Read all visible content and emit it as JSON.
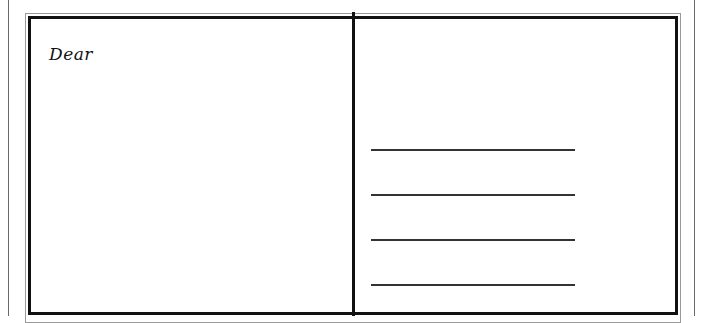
{
  "postcard": {
    "greeting": "Dear",
    "address_lines": [
      {
        "label": "address-line-1",
        "top": 149
      },
      {
        "label": "address-line-2",
        "top": 194
      },
      {
        "label": "address-line-3",
        "top": 239
      },
      {
        "label": "address-line-4",
        "top": 284
      }
    ]
  },
  "colors": {
    "border": "#111111",
    "frame": "#9a9a9a",
    "background": "#ffffff"
  }
}
